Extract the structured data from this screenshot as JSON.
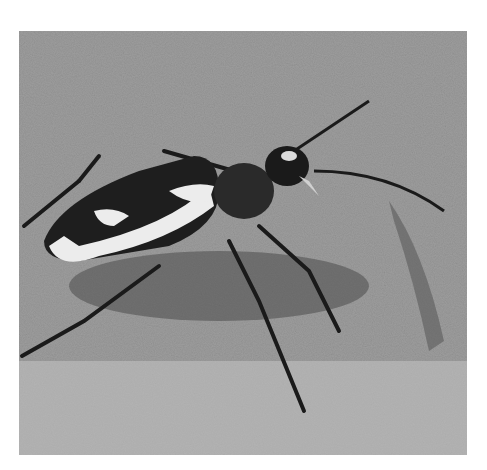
{
  "image": {
    "subject": "Tiger beetle on sand",
    "description": "Black-and-white close-up photograph of a tiger beetle with white-patterned elytra standing on sand",
    "colors": {
      "sand_light": "#c9c9c9",
      "sand_mid": "#9a9a9a",
      "beetle_dark": "#1e1e1e",
      "marking": "#eeeeee"
    }
  }
}
